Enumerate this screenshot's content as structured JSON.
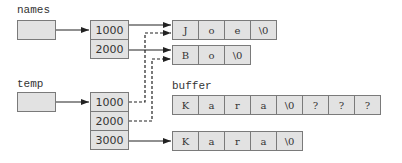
{
  "labels": {
    "names": "names",
    "temp": "temp",
    "buffer": "buffer"
  },
  "names_array": [
    "1000",
    "2000"
  ],
  "temp_array": [
    "1000",
    "2000",
    "3000"
  ],
  "strings": {
    "joe": [
      "J",
      "o",
      "e",
      "\\0"
    ],
    "bo": [
      "B",
      "o",
      "\\0"
    ],
    "buffer": [
      "K",
      "a",
      "r",
      "a",
      "\\0",
      "?",
      "?",
      "?"
    ],
    "kara": [
      "K",
      "a",
      "r",
      "a",
      "\\0"
    ]
  },
  "colors": {
    "cell_fill": "#e2e2e2",
    "border": "#7a7a7a",
    "line": "#222222"
  }
}
